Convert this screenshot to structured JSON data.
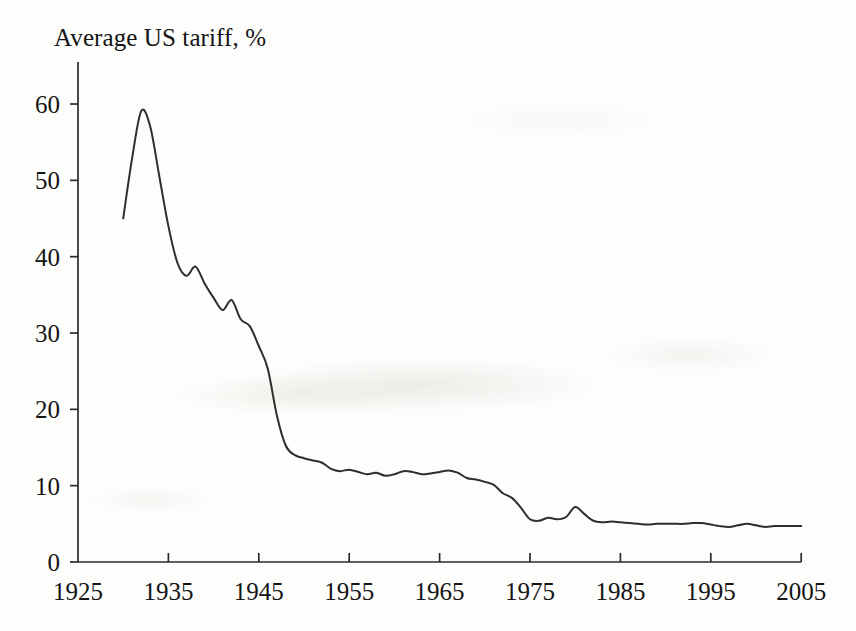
{
  "chart_data": {
    "type": "line",
    "title": "Average US tariff, %",
    "xlabel": "",
    "ylabel": "",
    "xlim": [
      1925,
      2005
    ],
    "ylim": [
      0,
      65
    ],
    "grid": false,
    "legend": "none",
    "x_ticks": [
      1925,
      1935,
      1945,
      1955,
      1965,
      1975,
      1985,
      1995,
      2005
    ],
    "y_ticks": [
      0,
      10,
      20,
      30,
      40,
      50,
      60
    ],
    "line_color": "#2e2e2e",
    "series": [
      {
        "name": "Average US tariff",
        "x": [
          1930,
          1931,
          1932,
          1933,
          1934,
          1935,
          1936,
          1937,
          1938,
          1939,
          1940,
          1941,
          1942,
          1943,
          1944,
          1945,
          1946,
          1947,
          1948,
          1949,
          1950,
          1951,
          1952,
          1953,
          1954,
          1955,
          1956,
          1957,
          1958,
          1959,
          1960,
          1961,
          1962,
          1963,
          1964,
          1965,
          1966,
          1967,
          1968,
          1969,
          1970,
          1971,
          1972,
          1973,
          1974,
          1975,
          1976,
          1977,
          1978,
          1979,
          1980,
          1981,
          1982,
          1983,
          1984,
          1985,
          1986,
          1987,
          1988,
          1989,
          1990,
          1991,
          1992,
          1993,
          1994,
          1995,
          1996,
          1997,
          1998,
          1999,
          2000,
          2001,
          2002,
          2003,
          2004,
          2005
        ],
        "values": [
          45.0,
          53.0,
          59.1,
          57.0,
          50.5,
          44.0,
          39.2,
          37.5,
          38.7,
          36.5,
          34.6,
          33.0,
          34.3,
          31.8,
          30.9,
          28.3,
          25.3,
          19.2,
          15.2,
          14.0,
          13.6,
          13.3,
          13.0,
          12.2,
          11.9,
          12.1,
          11.8,
          11.5,
          11.7,
          11.3,
          11.5,
          11.9,
          11.8,
          11.5,
          11.6,
          11.8,
          12.0,
          11.7,
          11.0,
          10.8,
          10.5,
          10.1,
          9.0,
          8.4,
          7.1,
          5.6,
          5.4,
          5.8,
          5.6,
          5.9,
          7.2,
          6.3,
          5.4,
          5.2,
          5.3,
          5.2,
          5.1,
          5.0,
          4.9,
          5.0,
          5.0,
          5.0,
          5.0,
          5.1,
          5.1,
          4.9,
          4.7,
          4.6,
          4.8,
          5.0,
          4.8,
          4.6,
          4.7,
          4.7,
          4.7,
          4.7
        ]
      }
    ]
  }
}
